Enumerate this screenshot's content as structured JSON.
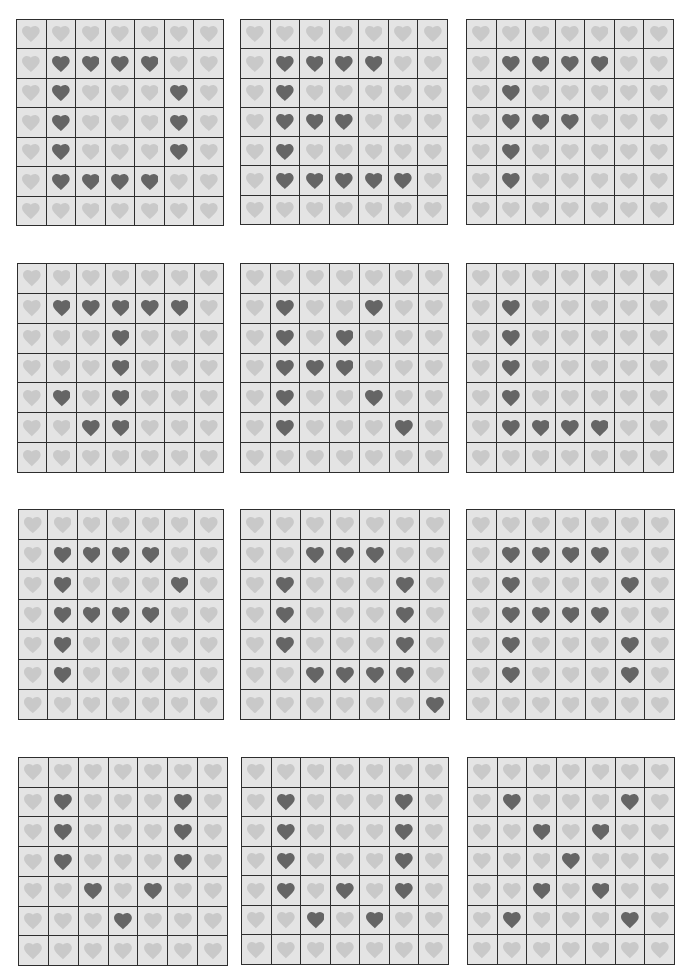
{
  "colors": {
    "background": "#ffffff",
    "cell": "#e4e4e4",
    "grid_line": "#2e2e2e",
    "heart_off": "#c9c9c9",
    "heart_on": "#656565"
  },
  "grid_size": 7,
  "boards": [
    {
      "letter": "D",
      "x": 16,
      "y": 19,
      "w": 208,
      "h": 207,
      "rows": [
        "0000000",
        "0111100",
        "0100010",
        "0100010",
        "0100010",
        "0111100",
        "0000000"
      ]
    },
    {
      "letter": "E",
      "x": 240,
      "y": 19,
      "w": 208,
      "h": 206,
      "rows": [
        "0000000",
        "0111100",
        "0100000",
        "0111000",
        "0100000",
        "0111110",
        "0000000"
      ]
    },
    {
      "letter": "F",
      "x": 466,
      "y": 19,
      "w": 208,
      "h": 206,
      "rows": [
        "0000000",
        "0111100",
        "0100000",
        "0111000",
        "0100000",
        "0100000",
        "0000000"
      ]
    },
    {
      "letter": "J",
      "x": 17,
      "y": 263,
      "w": 207,
      "h": 210,
      "rows": [
        "0000000",
        "0111110",
        "0001000",
        "0001000",
        "0101000",
        "0011000",
        "0000000"
      ]
    },
    {
      "letter": "K",
      "x": 240,
      "y": 263,
      "w": 209,
      "h": 210,
      "rows": [
        "0000000",
        "0100100",
        "0101000",
        "0111000",
        "0100100",
        "0100010",
        "0000000"
      ]
    },
    {
      "letter": "L",
      "x": 466,
      "y": 263,
      "w": 208,
      "h": 210,
      "rows": [
        "0000000",
        "0100000",
        "0100000",
        "0100000",
        "0100000",
        "0111100",
        "0000000"
      ]
    },
    {
      "letter": "P",
      "x": 18,
      "y": 509,
      "w": 206,
      "h": 211,
      "rows": [
        "0000000",
        "0111100",
        "0100010",
        "0111100",
        "0100000",
        "0100000",
        "0000000"
      ]
    },
    {
      "letter": "Q",
      "x": 240,
      "y": 509,
      "w": 210,
      "h": 211,
      "rows": [
        "0000000",
        "0011100",
        "0100010",
        "0100010",
        "0100010",
        "0011110",
        "0000001"
      ]
    },
    {
      "letter": "R",
      "x": 466,
      "y": 509,
      "w": 209,
      "h": 211,
      "rows": [
        "0000000",
        "0111100",
        "0100010",
        "0111100",
        "0100010",
        "0100010",
        "0000000"
      ]
    },
    {
      "letter": "U",
      "x": 18,
      "y": 757,
      "w": 210,
      "h": 209,
      "rows": [
        "0000000",
        "0100010",
        "0100010",
        "0100010",
        "0010100",
        "0001000",
        "0000000"
      ]
    },
    {
      "letter": "W",
      "x": 241,
      "y": 757,
      "w": 208,
      "h": 208,
      "rows": [
        "0000000",
        "0100010",
        "0100010",
        "0100010",
        "0101010",
        "0010100",
        "0000000"
      ]
    },
    {
      "letter": "X",
      "x": 467,
      "y": 757,
      "w": 208,
      "h": 208,
      "rows": [
        "0000000",
        "0100010",
        "0010100",
        "0001000",
        "0010100",
        "0100010",
        "0000000"
      ]
    }
  ]
}
